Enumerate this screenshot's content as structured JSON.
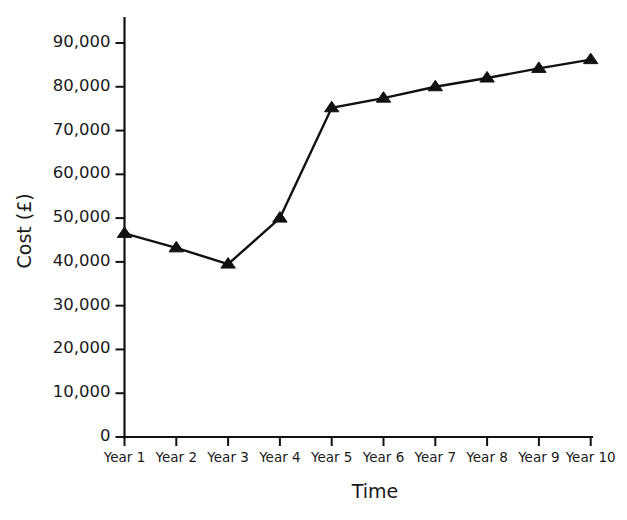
{
  "chart_data": {
    "type": "line",
    "title": "",
    "xlabel": "Time",
    "ylabel": "Cost (£)",
    "categories": [
      "Year 1",
      "Year 2",
      "Year 3",
      "Year 4",
      "Year 5",
      "Year 6",
      "Year 7",
      "Year 8",
      "Year 9",
      "Year 10"
    ],
    "values": [
      46500,
      43200,
      39500,
      50000,
      75200,
      77400,
      80000,
      82000,
      84200,
      86200
    ],
    "series": [
      {
        "name": "Cost",
        "values": [
          46500,
          43200,
          39500,
          50000,
          75200,
          77400,
          80000,
          82000,
          84200,
          86200
        ]
      }
    ],
    "ylim": [
      0,
      90000
    ],
    "yticks": [
      0,
      10000,
      20000,
      30000,
      40000,
      50000,
      60000,
      70000,
      80000,
      90000
    ],
    "ytick_labels": [
      "0",
      "10,000",
      "20,000",
      "30,000",
      "40,000",
      "50,000",
      "60,000",
      "70,000",
      "80,000",
      "90,000"
    ],
    "grid": false,
    "legend": null,
    "marker": "triangle-up",
    "marker_color": "#111111",
    "line_color": "#111111",
    "background_color": "#ffffff"
  },
  "axes": {
    "y_axis_name": "cost-axis",
    "x_axis_name": "time-axis"
  }
}
